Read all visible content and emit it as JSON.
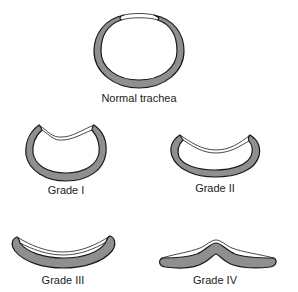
{
  "figure": {
    "fill_color": "#8f8f8f",
    "stroke_color": "#1a1a1a",
    "membrane_color": "#ffffff",
    "panels": [
      {
        "id": "normal",
        "label": "Normal trachea"
      },
      {
        "id": "grade1",
        "label": "Grade I"
      },
      {
        "id": "grade2",
        "label": "Grade II"
      },
      {
        "id": "grade3",
        "label": "Grade III"
      },
      {
        "id": "grade4",
        "label": "Grade IV"
      }
    ]
  }
}
